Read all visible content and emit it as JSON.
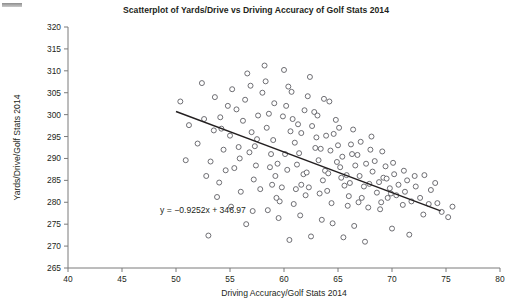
{
  "chart_data": {
    "type": "scatter",
    "title": "Scatterplot of Yards/Drive vs Driving Accuracy of Golf Stats 2014",
    "xlabel": "Driving Accuracy/Golf Stats 2014",
    "ylabel": "Yards/Drive/Golf Stats 2014",
    "xlim": [
      40,
      80
    ],
    "ylim": [
      265,
      320
    ],
    "xticks": [
      40,
      45,
      50,
      55,
      60,
      65,
      70,
      75,
      80
    ],
    "yticks": [
      265,
      270,
      275,
      280,
      285,
      290,
      295,
      300,
      305,
      310,
      315,
      320
    ],
    "grid": false,
    "legend": null,
    "annotations": [
      {
        "name": "regression-equation",
        "text": "y = −0.9252x + 346.97",
        "x": 52.5,
        "y": 277.6
      }
    ],
    "trendline": {
      "name": "least-squares-fit",
      "slope": -0.9252,
      "intercept": 346.97,
      "x_start": 50.0,
      "x_end": 74.5,
      "color": "#231f20"
    },
    "marker": {
      "shape": "circle-open",
      "size": 5,
      "fill": "#ffffff",
      "stroke": "#5f5f64"
    },
    "points": [
      [
        50.4,
        303.0
      ],
      [
        51.2,
        297.6
      ],
      [
        52.4,
        307.2
      ],
      [
        52.0,
        293.4
      ],
      [
        53.5,
        296.4
      ],
      [
        54.1,
        299.4
      ],
      [
        53.2,
        289.3
      ],
      [
        54.6,
        287.3
      ],
      [
        54.0,
        284.5
      ],
      [
        53.8,
        281.2
      ],
      [
        55.2,
        305.8
      ],
      [
        55.6,
        301.2
      ],
      [
        55.0,
        295.2
      ],
      [
        55.8,
        292.6
      ],
      [
        56.2,
        298.6
      ],
      [
        56.6,
        309.4
      ],
      [
        56.4,
        303.4
      ],
      [
        57.0,
        296.0
      ],
      [
        56.8,
        291.4
      ],
      [
        57.4,
        288.4
      ],
      [
        57.2,
        285.2
      ],
      [
        57.8,
        283.0
      ],
      [
        58.2,
        311.2
      ],
      [
        58.0,
        305.0
      ],
      [
        58.6,
        300.2
      ],
      [
        58.4,
        297.0
      ],
      [
        59.0,
        294.2
      ],
      [
        58.8,
        291.0
      ],
      [
        59.4,
        288.8
      ],
      [
        59.2,
        286.0
      ],
      [
        59.8,
        283.4
      ],
      [
        59.6,
        280.2
      ],
      [
        60.0,
        310.2
      ],
      [
        60.4,
        306.4
      ],
      [
        60.2,
        302.0
      ],
      [
        60.8,
        299.0
      ],
      [
        60.6,
        296.2
      ],
      [
        61.0,
        293.6
      ],
      [
        61.4,
        291.2
      ],
      [
        61.2,
        288.6
      ],
      [
        61.8,
        286.4
      ],
      [
        61.6,
        284.0
      ],
      [
        62.0,
        281.6
      ],
      [
        62.4,
        308.6
      ],
      [
        62.2,
        304.2
      ],
      [
        62.8,
        300.6
      ],
      [
        62.6,
        297.4
      ],
      [
        63.0,
        294.8
      ],
      [
        63.4,
        292.2
      ],
      [
        63.2,
        289.6
      ],
      [
        63.8,
        287.2
      ],
      [
        63.6,
        285.0
      ],
      [
        64.0,
        282.6
      ],
      [
        64.4,
        279.8
      ],
      [
        64.2,
        303.0
      ],
      [
        64.8,
        298.8
      ],
      [
        64.6,
        295.6
      ],
      [
        65.0,
        293.0
      ],
      [
        65.4,
        290.4
      ],
      [
        65.2,
        288.0
      ],
      [
        65.8,
        286.2
      ],
      [
        65.6,
        283.8
      ],
      [
        66.0,
        281.4
      ],
      [
        66.4,
        296.6
      ],
      [
        66.2,
        293.2
      ],
      [
        66.8,
        290.8
      ],
      [
        66.6,
        288.4
      ],
      [
        67.0,
        286.0
      ],
      [
        67.4,
        283.6
      ],
      [
        67.2,
        281.0
      ],
      [
        67.8,
        278.8
      ],
      [
        68.0,
        292.0
      ],
      [
        68.4,
        289.4
      ],
      [
        68.2,
        287.0
      ],
      [
        68.8,
        284.6
      ],
      [
        68.6,
        282.2
      ],
      [
        69.0,
        280.0
      ],
      [
        69.4,
        288.2
      ],
      [
        69.2,
        285.6
      ],
      [
        69.8,
        283.2
      ],
      [
        69.6,
        281.0
      ],
      [
        70.2,
        286.4
      ],
      [
        70.6,
        284.0
      ],
      [
        70.4,
        281.6
      ],
      [
        71.0,
        279.4
      ],
      [
        71.4,
        285.0
      ],
      [
        71.2,
        282.4
      ],
      [
        71.8,
        280.2
      ],
      [
        72.2,
        283.6
      ],
      [
        72.6,
        281.0
      ],
      [
        73.0,
        286.2
      ],
      [
        73.4,
        279.6
      ],
      [
        74.0,
        284.4
      ],
      [
        74.6,
        277.8
      ],
      [
        75.2,
        276.6
      ],
      [
        75.6,
        279.0
      ],
      [
        52.8,
        286.0
      ],
      [
        54.4,
        292.0
      ],
      [
        55.4,
        287.8
      ],
      [
        56.0,
        282.4
      ],
      [
        57.6,
        299.8
      ],
      [
        58.3,
        307.6
      ],
      [
        59.1,
        302.6
      ],
      [
        60.1,
        291.0
      ],
      [
        61.1,
        283.0
      ],
      [
        62.1,
        286.8
      ],
      [
        63.1,
        299.8
      ],
      [
        64.1,
        286.6
      ],
      [
        65.1,
        297.0
      ],
      [
        66.1,
        284.4
      ],
      [
        67.1,
        293.8
      ],
      [
        68.1,
        295.0
      ],
      [
        69.1,
        291.6
      ],
      [
        70.1,
        289.0
      ],
      [
        71.1,
        287.2
      ],
      [
        72.1,
        286.0
      ],
      [
        56.5,
        275.0
      ],
      [
        60.5,
        271.4
      ],
      [
        62.5,
        272.2
      ],
      [
        65.5,
        272.0
      ],
      [
        67.5,
        271.0
      ],
      [
        53.0,
        272.4
      ],
      [
        58.5,
        278.2
      ],
      [
        61.5,
        277.0
      ],
      [
        63.5,
        276.0
      ],
      [
        59.5,
        276.4
      ],
      [
        64.5,
        275.2
      ],
      [
        66.5,
        274.6
      ],
      [
        70.0,
        274.0
      ],
      [
        71.6,
        272.6
      ],
      [
        57.1,
        278.0
      ],
      [
        55.1,
        279.0
      ],
      [
        54.8,
        302.0
      ],
      [
        56.9,
        306.6
      ],
      [
        59.9,
        299.6
      ],
      [
        61.9,
        301.0
      ],
      [
        63.9,
        295.2
      ],
      [
        60.3,
        287.4
      ],
      [
        62.3,
        283.4
      ],
      [
        64.3,
        291.8
      ],
      [
        58.9,
        284.0
      ],
      [
        57.5,
        294.4
      ],
      [
        66.9,
        280.0
      ],
      [
        68.9,
        278.4
      ],
      [
        54.2,
        296.8
      ],
      [
        55.9,
        290.0
      ],
      [
        61.6,
        295.8
      ],
      [
        62.9,
        292.4
      ],
      [
        64.9,
        289.2
      ],
      [
        67.6,
        288.8
      ],
      [
        59.3,
        281.0
      ],
      [
        60.9,
        279.6
      ],
      [
        63.3,
        282.0
      ],
      [
        65.9,
        279.2
      ],
      [
        69.5,
        285.4
      ],
      [
        72.9,
        277.2
      ],
      [
        74.2,
        279.8
      ],
      [
        50.9,
        289.6
      ],
      [
        52.6,
        299.0
      ],
      [
        53.6,
        304.0
      ],
      [
        58.7,
        288.0
      ],
      [
        66.3,
        291.0
      ],
      [
        60.7,
        305.2
      ],
      [
        63.7,
        303.6
      ],
      [
        57.3,
        292.8
      ],
      [
        61.3,
        297.8
      ],
      [
        65.3,
        285.6
      ],
      [
        67.9,
        284.2
      ],
      [
        69.9,
        282.0
      ],
      [
        73.6,
        282.8
      ]
    ]
  }
}
